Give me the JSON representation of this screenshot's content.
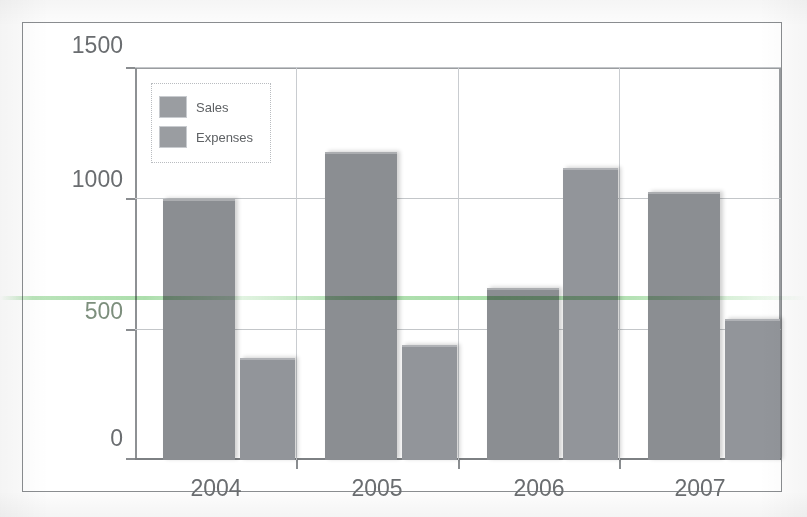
{
  "chart_data": {
    "type": "bar",
    "title": "",
    "subtitle": "",
    "xlabel": "",
    "ylabel": "",
    "categories": [
      "2004",
      "2005",
      "2006",
      "2007"
    ],
    "series": [
      {
        "name": "Sales",
        "values": [
          1000,
          1180,
          660,
          1030
        ],
        "color": "#8b8e92"
      },
      {
        "name": "Expenses",
        "values": [
          390,
          440,
          1120,
          540
        ],
        "color": "#92959a"
      }
    ],
    "ylim": [
      0,
      1500
    ],
    "yticks": [
      0,
      500,
      1000,
      1500
    ],
    "ytick_labels": [
      "0",
      "500",
      "1000",
      "1500"
    ],
    "grid": "horizontal-and-category-separators",
    "legend_position": "top-left-inside"
  },
  "legend": {
    "items": [
      {
        "label": "Sales",
        "swatch": "gray-swatch"
      },
      {
        "label": "Expenses",
        "swatch": "gray-swatch"
      }
    ]
  },
  "axes": {
    "y_tick_labels": [
      "1500",
      "1000",
      "500",
      "0"
    ],
    "x_tick_labels": [
      "2004",
      "2005",
      "2006",
      "2007"
    ]
  },
  "artifacts": {
    "scan_line_color": "#5abe5a",
    "frame_color": "#8a8d90",
    "gridline_color": "#c3c6c9",
    "text_color": "#6a6d70",
    "background": "#ffffff"
  }
}
